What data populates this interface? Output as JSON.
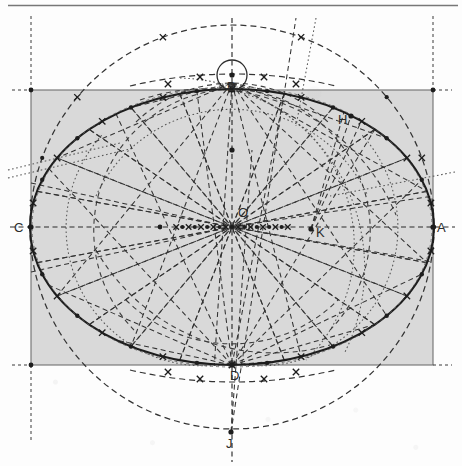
{
  "figure": {
    "type": "geometric-diagram",
    "canvas": {
      "width": 462,
      "height": 466
    },
    "background_color": "#fdfdfd",
    "ink_color": "#2b2b2b",
    "shade_color": "#d9d9d9"
  },
  "labels": {
    "A": "A",
    "B": "B",
    "C": "C",
    "D": "D",
    "H": "H",
    "J": "J",
    "K": "K",
    "O": "O"
  },
  "points": {
    "A": {
      "label": "A",
      "x": 433,
      "y": 227,
      "label_x": 437,
      "label_y": 232,
      "role": "right-vertex"
    },
    "C": {
      "label": "C",
      "x": 31,
      "y": 227,
      "label_x": 17,
      "label_y": 232,
      "role": "left-vertex"
    },
    "B": {
      "label": "B",
      "x": 232,
      "y": 75,
      "label_x": 228,
      "label_y": 90,
      "role": "top-auxiliary-point"
    },
    "D": {
      "label": "D",
      "x": 232,
      "y": 365,
      "label_x": 228,
      "label_y": 379,
      "role": "bottom-vertex"
    },
    "H": {
      "label": "H",
      "x": 351,
      "y": 116,
      "label_x": 339,
      "label_y": 124,
      "role": "upper-right-point"
    },
    "J": {
      "label": "J",
      "x": 231,
      "y": 432,
      "label_x": 227,
      "label_y": 447,
      "role": "lower-pole"
    },
    "K": {
      "label": "K",
      "x": 311,
      "y": 229,
      "label_x": 316,
      "label_y": 236,
      "role": "right-focus-like-point"
    },
    "O": {
      "label": "O",
      "x": 232,
      "y": 227,
      "label_x": 238,
      "label_y": 216,
      "role": "center"
    }
  },
  "geometry": {
    "ellipse": {
      "cx": 232,
      "cy": 227,
      "rx": 202,
      "ry": 138,
      "stroke": "#2b2b2b",
      "stroke_width": 2.1,
      "style": "solid"
    },
    "big_circle": {
      "cx": 232,
      "cy": 227,
      "r": 202,
      "style": "dashed"
    },
    "small_circle_at_B": {
      "cx": 232,
      "cy": 75,
      "r": 15,
      "style": "solid"
    },
    "rectangle": {
      "x": 31,
      "y": 90,
      "width": 402,
      "height": 275,
      "fill": "#d9d9d9",
      "stroke": "#777777"
    },
    "major_axis": {
      "x1": 10,
      "y1": 227,
      "x2": 455,
      "y2": 227,
      "style": "dashed"
    },
    "minor_axis": {
      "x1": 232,
      "y1": 20,
      "x2": 232,
      "y2": 462,
      "style": "dashed"
    },
    "top_rule": {
      "x1": 8,
      "y1": 5,
      "x2": 458,
      "y2": 5
    }
  },
  "chart_data": {
    "type": "scatter",
    "xlabel": "",
    "ylabel": "",
    "grid": false,
    "legend": "none",
    "xlim": [
      0,
      462
    ],
    "ylim": [
      466,
      0
    ],
    "annotations": [
      "A",
      "B",
      "C",
      "D",
      "H",
      "J",
      "K",
      "O"
    ],
    "series": [
      {
        "name": "labeled points",
        "x": [
          433,
          232,
          31,
          232,
          351,
          231,
          311,
          232
        ],
        "y": [
          227,
          75,
          227,
          365,
          116,
          432,
          229,
          227
        ],
        "labels": [
          "A",
          "B",
          "C",
          "D",
          "H",
          "J",
          "K",
          "O"
        ]
      },
      {
        "name": "ellipse construction marks",
        "x": [
          99,
          132,
          168,
          200,
          264,
          299,
          334,
          365,
          99,
          132,
          168,
          200,
          264,
          299,
          334,
          365
        ],
        "y": [
          121,
          104,
          95,
          91,
          91,
          95,
          104,
          121,
          333,
          350,
          359,
          363,
          363,
          359,
          350,
          333
        ]
      }
    ]
  },
  "radials": {
    "description": "dashed chords and radial construction lines through the center",
    "angles_deg": [
      0,
      15,
      30,
      45,
      60,
      75,
      90,
      105,
      120,
      135,
      150,
      165,
      180,
      195,
      210,
      225,
      240,
      255,
      270,
      285,
      300,
      315,
      330,
      345
    ]
  },
  "scan_artifacts": {
    "bottom_text": "",
    "has_top_rule": true,
    "has_paper_grain": true
  }
}
